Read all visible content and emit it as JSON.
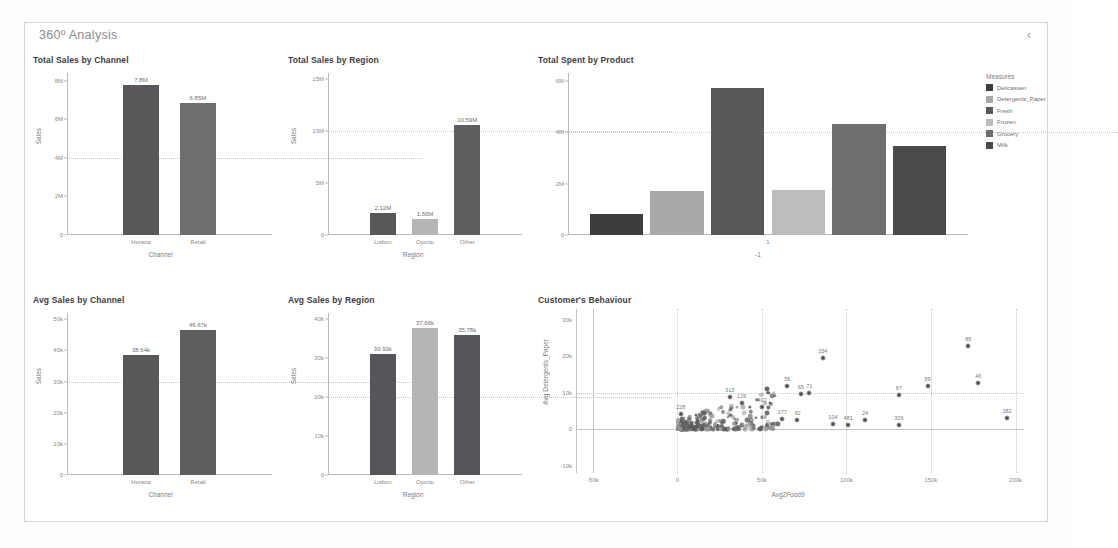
{
  "header": {
    "title": "360º Analysis",
    "collapse_icon": "chevron-left-icon",
    "collapse_glyph": "‹"
  },
  "colors": {
    "dark": "#58585a",
    "mid": "#8a8a8c",
    "light": "#bdbdbf",
    "darkest": "#3d3d3f",
    "axis": "#b9b9b9",
    "text": "#6f6f6f"
  },
  "chart_data": [
    {
      "id": "total-sales-by-channel",
      "type": "bar",
      "title": "Total Sales by Channel",
      "xlabel": "Channel",
      "ylabel": "Sales",
      "categories": [
        "Horeca",
        "Retail"
      ],
      "values": [
        7800000,
        6850000
      ],
      "value_labels": [
        "7.8M",
        "6.85M"
      ],
      "yticks": [
        0,
        2000000,
        4000000,
        6000000,
        8000000
      ],
      "ytick_labels": [
        "0",
        "2M",
        "4M",
        "6M",
        "8M"
      ],
      "ylim": [
        0,
        8400000
      ],
      "grid": true
    },
    {
      "id": "total-sales-by-region",
      "type": "bar",
      "title": "Total Sales by Region",
      "xlabel": "Region",
      "ylabel": "Sales",
      "categories": [
        "Lisbon",
        "Oporto",
        "Other"
      ],
      "values": [
        2120000,
        1560000,
        10590000
      ],
      "value_labels": [
        "2.12M",
        "1.56M",
        "10.59M"
      ],
      "yticks": [
        0,
        5000000,
        10000000,
        15000000
      ],
      "ytick_labels": [
        "0",
        "5M",
        "10M",
        "15M"
      ],
      "ylim": [
        0,
        15600000
      ],
      "grid": true
    },
    {
      "id": "avg-sales-by-channel",
      "type": "bar",
      "title": "Avg Sales by Channel",
      "xlabel": "Channel",
      "ylabel": "Sales",
      "categories": [
        "Horeca",
        "Retail"
      ],
      "values": [
        38640,
        46670
      ],
      "value_labels": [
        "38.64k",
        "46.67k"
      ],
      "yticks": [
        0,
        10000,
        20000,
        30000,
        40000,
        50000
      ],
      "ytick_labels": [
        "0",
        "10k",
        "20k",
        "30k",
        "40k",
        "50k"
      ],
      "ylim": [
        0,
        52000
      ],
      "grid": true
    },
    {
      "id": "avg-sales-by-region",
      "type": "bar",
      "title": "Avg Sales by Region",
      "xlabel": "Region",
      "ylabel": "Sales",
      "categories": [
        "Lisbon",
        "Oporto",
        "Other"
      ],
      "values": [
        30930,
        37660,
        35780
      ],
      "value_labels": [
        "30.93k",
        "37.66k",
        "35.78k"
      ],
      "yticks": [
        0,
        10000,
        20000,
        30000,
        40000
      ],
      "ytick_labels": [
        "0",
        "10k",
        "20k",
        "30k",
        "40k"
      ],
      "ylim": [
        0,
        41500
      ],
      "grid": true
    },
    {
      "id": "total-spent-by-product",
      "type": "bar",
      "title": "Total Spent by Product",
      "xlabel": "-1",
      "ylabel": "",
      "xtick_label": "1",
      "categories": [
        "Delicassen",
        "Detergents_Paper",
        "Fresh",
        "Frozen",
        "Grocery",
        "Milk"
      ],
      "values": [
        800000,
        1700000,
        5700000,
        1750000,
        4300000,
        3450000
      ],
      "yticks": [
        0,
        2000000,
        4000000,
        6000000
      ],
      "ytick_labels": [
        "0",
        "2M",
        "4M",
        "6M"
      ],
      "ylim": [
        0,
        6300000
      ],
      "grid": true,
      "legend": {
        "title": "Measures",
        "position": "right",
        "entries": [
          {
            "label": "Delicassen",
            "color": "#3d3d3f"
          },
          {
            "label": "Detergents_Paper",
            "color": "#a9a9ab"
          },
          {
            "label": "Fresh",
            "color": "#58585a"
          },
          {
            "label": "Frozen",
            "color": "#bdbdbf"
          },
          {
            "label": "Grocery",
            "color": "#6e6e70"
          },
          {
            "label": "Milk",
            "color": "#4a4a4c"
          }
        ]
      }
    },
    {
      "id": "customers-behaviour",
      "type": "scatter",
      "title": "Customer's Behaviour",
      "xlabel": "Avg2Food9",
      "ylabel": "Avg Detergents_Paper",
      "xticks": [
        -50000,
        0,
        50000,
        100000,
        150000,
        200000
      ],
      "xtick_labels": [
        "-50k",
        "0",
        "50k",
        "100k",
        "150k",
        "200k"
      ],
      "yticks": [
        -10000,
        0,
        10000,
        20000,
        30000
      ],
      "ytick_labels": [
        "-10k",
        "0",
        "10k",
        "20k",
        "30k"
      ],
      "xlim": [
        -60000,
        205000
      ],
      "ylim": [
        -12000,
        33000
      ],
      "grid": true,
      "labeled_points": [
        {
          "label": "228",
          "x": 2000,
          "y": 4200
        },
        {
          "label": "313",
          "x": 31000,
          "y": 8800
        },
        {
          "label": "126",
          "x": 38000,
          "y": 7200
        },
        {
          "label": "402",
          "x": 50000,
          "y": 6200
        },
        {
          "label": "56",
          "x": 65000,
          "y": 11800
        },
        {
          "label": "65",
          "x": 73000,
          "y": 9600
        },
        {
          "label": "71",
          "x": 78000,
          "y": 9900
        },
        {
          "label": "334",
          "x": 86000,
          "y": 19500
        },
        {
          "label": "177",
          "x": 62000,
          "y": 2700
        },
        {
          "label": "92",
          "x": 71000,
          "y": 2500
        },
        {
          "label": "104",
          "x": 92000,
          "y": 1500
        },
        {
          "label": "481",
          "x": 101000,
          "y": 1200
        },
        {
          "label": "24",
          "x": 111000,
          "y": 2600
        },
        {
          "label": "326",
          "x": 131000,
          "y": 1100
        },
        {
          "label": "87",
          "x": 131000,
          "y": 9400
        },
        {
          "label": "59",
          "x": 148000,
          "y": 12000
        },
        {
          "label": "85",
          "x": 172000,
          "y": 22800
        },
        {
          "label": "46",
          "x": 178000,
          "y": 12700
        },
        {
          "label": "182",
          "x": 195000,
          "y": 3200
        }
      ]
    }
  ]
}
